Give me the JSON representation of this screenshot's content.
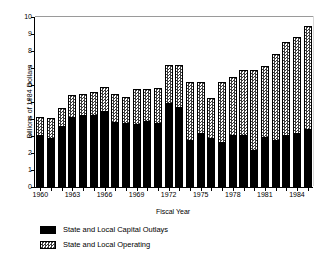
{
  "chart_data": {
    "type": "bar",
    "title": "",
    "subtitle": "",
    "xlabel": "Fiscal Year",
    "ylabel": "Billions of 1984 Dollars",
    "ylim": [
      0,
      10
    ],
    "ytick_labels": [
      "0",
      "1",
      "2",
      "3",
      "4",
      "5",
      "6",
      "7",
      "8",
      "9",
      "10"
    ],
    "ytick_values": [
      0,
      1,
      2,
      3,
      4,
      5,
      6,
      7,
      8,
      9,
      10
    ],
    "grid": false,
    "stacked": true,
    "legend_position": "below-left",
    "categories": [
      "1960",
      "1961",
      "1962",
      "1963",
      "1964",
      "1965",
      "1966",
      "1967",
      "1968",
      "1969",
      "1970",
      "1971",
      "1972",
      "1973",
      "1974",
      "1975",
      "1976",
      "1977",
      "1978",
      "1979",
      "1980",
      "1981",
      "1982",
      "1983",
      "1984",
      "1985"
    ],
    "xtick_labels": [
      "1960",
      "1963",
      "1966",
      "1969",
      "1972",
      "1975",
      "1978",
      "1981",
      "1984"
    ],
    "xtick_categories": [
      "1960",
      "1963",
      "1966",
      "1969",
      "1972",
      "1975",
      "1978",
      "1981",
      "1984"
    ],
    "series": [
      {
        "name": "State and Local Capital Outlays",
        "color": "#000000",
        "pattern": "solid",
        "values": [
          3.0,
          2.8,
          3.55,
          4.05,
          4.2,
          4.2,
          4.4,
          3.75,
          3.7,
          3.65,
          3.85,
          3.7,
          4.9,
          4.65,
          2.7,
          3.1,
          2.8,
          2.6,
          3.0,
          3.0,
          2.1,
          2.9,
          2.7,
          3.0,
          3.1,
          3.35
        ]
      },
      {
        "name": "State and Local Operating",
        "color": "#3d3d3d",
        "pattern": "checker",
        "values": [
          1.1,
          1.25,
          1.1,
          1.35,
          1.3,
          1.4,
          1.5,
          1.7,
          1.6,
          2.1,
          1.9,
          2.15,
          2.3,
          2.55,
          3.5,
          3.1,
          2.45,
          3.6,
          3.5,
          3.9,
          4.8,
          4.2,
          5.1,
          5.55,
          5.7,
          6.15
        ]
      }
    ],
    "totals": [
      4.1,
      4.05,
      4.65,
      5.4,
      5.5,
      5.6,
      5.9,
      5.45,
      5.3,
      5.75,
      5.75,
      5.85,
      7.2,
      7.2,
      6.2,
      6.2,
      5.25,
      6.2,
      6.5,
      6.9,
      6.9,
      7.1,
      7.8,
      8.55,
      8.8,
      9.5
    ]
  },
  "legend": {
    "items": [
      {
        "label": "State and Local Capital Outlays",
        "swatch": "solid-black"
      },
      {
        "label": "State and Local Operating",
        "swatch": "checker-gray"
      }
    ]
  }
}
